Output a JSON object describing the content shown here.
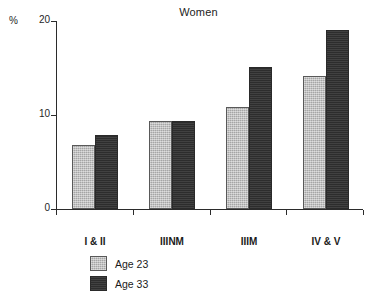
{
  "chart_data": {
    "type": "bar",
    "title": "Women",
    "xlabel": "",
    "ylabel": "%",
    "ylim": [
      0,
      20
    ],
    "yticks": [
      0,
      10,
      20
    ],
    "ytick_labels": [
      "0",
      "10",
      "20"
    ],
    "grid": false,
    "legend_position": "bottom-left",
    "categories": [
      "I & II",
      "IIINM",
      "IIIM",
      "IV & V"
    ],
    "series": [
      {
        "name": "Age 23",
        "color": "#b9b9b9",
        "values": [
          6.8,
          9.4,
          10.8,
          14.2
        ]
      },
      {
        "name": "Age 33",
        "color": "#333333",
        "values": [
          7.9,
          9.4,
          15.1,
          19.0
        ]
      }
    ]
  },
  "legend": {
    "items": [
      {
        "label": "Age 23",
        "swatch": "light-gray-swatch"
      },
      {
        "label": "Age 33",
        "swatch": "dark-swatch"
      }
    ]
  }
}
